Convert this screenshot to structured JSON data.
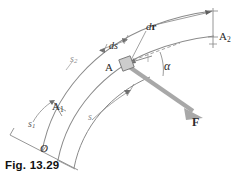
{
  "figure": {
    "caption": "Fig. 13.29",
    "background_color": "#ffffff",
    "line_color": "#777777",
    "force_color": "#a6a6a6",
    "text_color": "#2b2b2b"
  },
  "labels": {
    "origin": "O",
    "point_a": "A",
    "position_1": "A",
    "position_1_sub": "1",
    "position_2": "A",
    "position_2_sub": "2",
    "arc_s": "s",
    "arc_s1": "s",
    "arc_s1_sub": "1",
    "arc_s2": "s",
    "arc_s2_sub": "2",
    "ds": "ds",
    "dr_d": "d",
    "dr_r": "r",
    "alpha": "α",
    "force": "F"
  },
  "elements": {
    "particle_fill": "#c8c8c8",
    "force_arrow_label": "F",
    "angle_label": "α",
    "dashed_tangent": "tangent-dashed-line"
  }
}
